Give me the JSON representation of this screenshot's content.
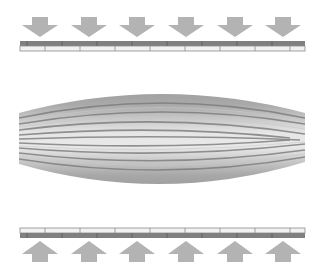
{
  "diagram": {
    "colors": {
      "arrow": "#b3b3b3",
      "plate_dark": "#808080",
      "plate_light": "#f2f2f2",
      "plate_border": "#8c8c8c",
      "body_outer": "#8a8a8a",
      "body_inner": "#e8e8e8",
      "fiber_line": "#7a7a7a"
    },
    "top_arrows": {
      "count": 6,
      "direction": "down",
      "x_centers": [
        40,
        89,
        137,
        186,
        235,
        283
      ]
    },
    "bottom_arrows": {
      "count": 6,
      "direction": "up",
      "x_centers": [
        40,
        89,
        137,
        186,
        235,
        283
      ]
    },
    "top_plate": {
      "segments": 9
    },
    "bottom_plate": {
      "segments": 9
    }
  }
}
